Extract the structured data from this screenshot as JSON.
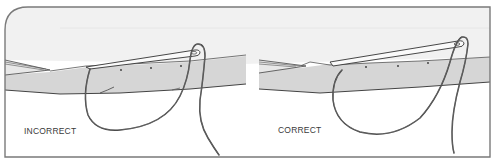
{
  "figure": {
    "colors": {
      "frame": "#7a7a7a",
      "sky_band": "#f1f1f1",
      "fabric_fold": "#d6d6d6",
      "thread": "#3c3c3c",
      "needle_fill": "#fafafa",
      "background": "#ffffff"
    },
    "panels": [
      {
        "id": "incorrect",
        "label": "INCORRECT",
        "thread_loop": "loop passes below fabric fold, exiting at needle eye"
      },
      {
        "id": "correct",
        "label": "CORRECT",
        "thread_loop": "larger loop under needle, thread wraps around needle eye"
      }
    ]
  }
}
